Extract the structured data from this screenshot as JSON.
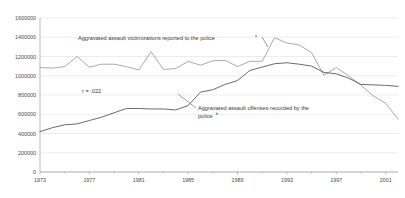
{
  "chart_data": {
    "type": "line",
    "title": "",
    "subtitle": "",
    "xlabel": "",
    "ylabel": "",
    "xlim": [
      1973,
      2002
    ],
    "ylim": [
      0,
      1600000
    ],
    "grid": true,
    "legend_position": "inline-annotations",
    "x": [
      1973,
      1974,
      1975,
      1976,
      1977,
      1978,
      1979,
      1980,
      1981,
      1982,
      1983,
      1984,
      1985,
      1986,
      1987,
      1988,
      1989,
      1990,
      1991,
      1992,
      1993,
      1994,
      1995,
      1996,
      1997,
      1998,
      1999,
      2000,
      2001,
      2002
    ],
    "x_tick_labels": [
      "1973",
      "1977",
      "1981",
      "1985",
      "1989",
      "1993",
      "1997",
      "2001"
    ],
    "x_tick_values": [
      1973,
      1977,
      1981,
      1985,
      1989,
      1993,
      1997,
      2001
    ],
    "x_minor_tick_values": [
      1975,
      1979,
      1983,
      1987,
      1991,
      1995,
      1999
    ],
    "y_tick_labels": [
      "0",
      "200000",
      "400000",
      "600000",
      "800000",
      "1000000",
      "1200000",
      "1400000",
      "1600000"
    ],
    "y_tick_values": [
      0,
      200000,
      400000,
      600000,
      800000,
      1000000,
      1200000,
      1400000,
      1600000
    ],
    "series": [
      {
        "name": "Aggravated assault victimizations reported to the police",
        "color": "#9a9a9a",
        "values": [
          1085000,
          1080000,
          1095000,
          1200000,
          1090000,
          1120000,
          1120000,
          1095000,
          1060000,
          1250000,
          1065000,
          1075000,
          1150000,
          1110000,
          1155000,
          1160000,
          1095000,
          1150000,
          1150000,
          1395000,
          1340000,
          1320000,
          1240000,
          1005000,
          1085000,
          1000000,
          900000,
          790000,
          715000,
          550000
        ]
      },
      {
        "name": "Aggravated assault offenses recorded by the police",
        "color": "#4f4f4f",
        "values": [
          420000,
          460000,
          490000,
          500000,
          535000,
          570000,
          615000,
          660000,
          660000,
          655000,
          655000,
          645000,
          690000,
          830000,
          855000,
          910000,
          950000,
          1055000,
          1090000,
          1125000,
          1135000,
          1120000,
          1100000,
          1035000,
          1020000,
          975000,
          910000,
          905000,
          900000,
          890000
        ]
      }
    ],
    "annotations": [
      {
        "id": "victimizations-label",
        "text": "Aggravated assault victimizations reported to the police",
        "superscript": "a"
      },
      {
        "id": "offenses-label",
        "text_line1": "Aggravated assault offenses recorded by the",
        "text_line2": "police",
        "superscript": "b"
      },
      {
        "id": "correlation-label",
        "text": "r = .022"
      }
    ]
  }
}
